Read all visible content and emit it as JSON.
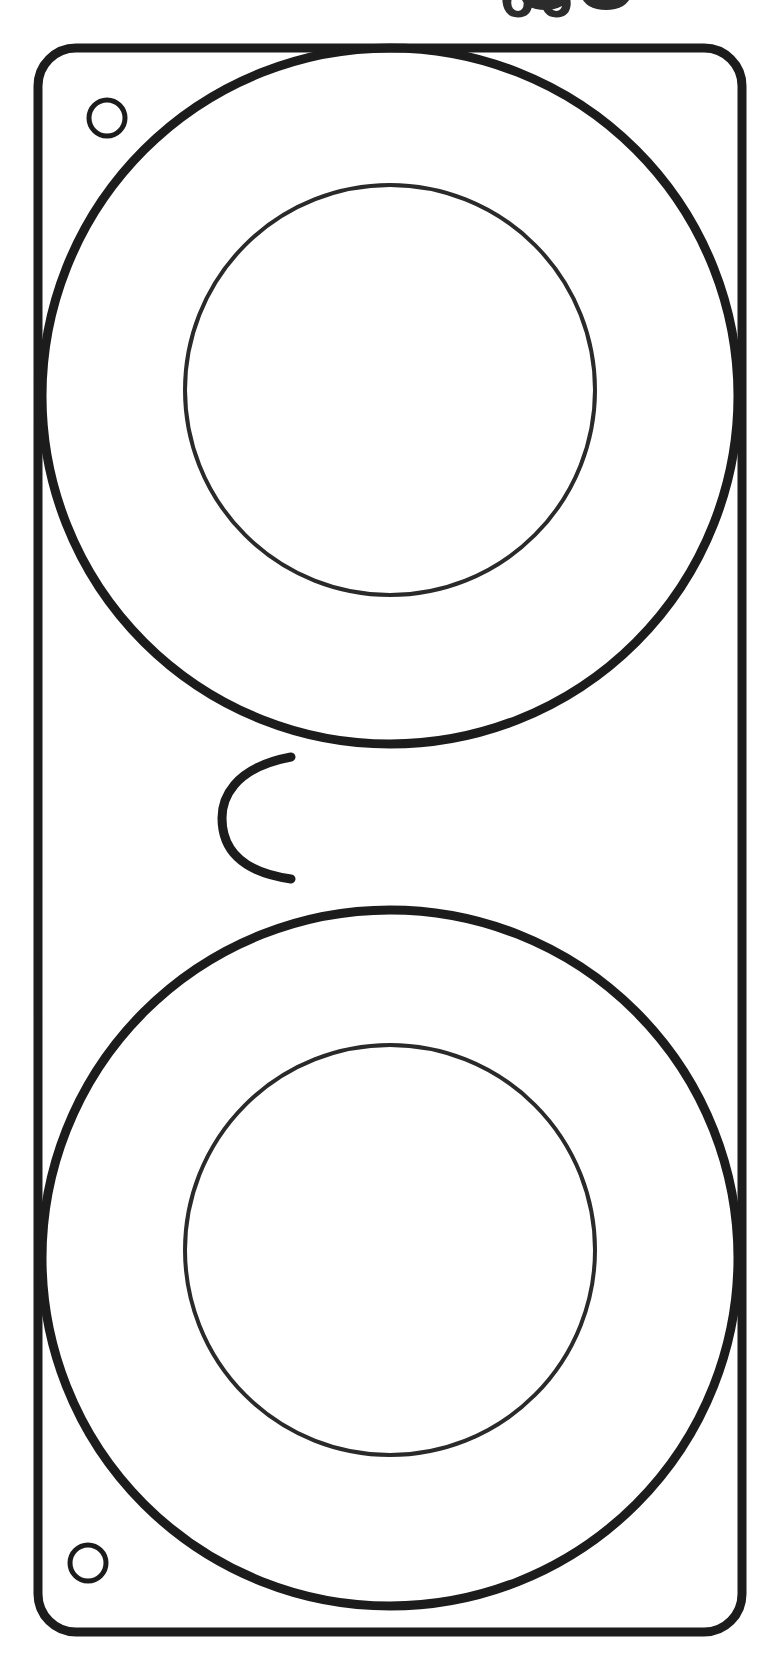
{
  "figure": {
    "kind": "technical-line-drawing",
    "canvas": {
      "width": 767,
      "height": 1661,
      "background": "#ffffff"
    },
    "ink": {
      "heavy": "#1c1c1c",
      "light": "#2a2a2a",
      "heavy_width": 9,
      "light_width": 4,
      "hole_width": 5
    },
    "caption": {
      "text": "66",
      "note": "partially cropped at top edge of image",
      "visible_fragment": "two rounded glyph bottoms"
    },
    "plate": {
      "name": "mounting-plate",
      "left": 38,
      "top": 48,
      "right": 742,
      "bottom": 1632,
      "corner_radius": 38,
      "stroke_width": 9
    },
    "bosses": [
      {
        "name": "upper-boss",
        "outer": {
          "cx": 390,
          "cy": 396,
          "r": 348,
          "stroke_width": 9
        },
        "inner": {
          "cx": 390,
          "cy": 390,
          "r": 205,
          "stroke_width": 4
        }
      },
      {
        "name": "lower-boss",
        "outer": {
          "cx": 390,
          "cy": 1258,
          "r": 348,
          "stroke_width": 9
        },
        "inner": {
          "cx": 390,
          "cy": 1250,
          "r": 205,
          "stroke_width": 4
        }
      }
    ],
    "waist": {
      "name": "bridge-waist",
      "top_junction": {
        "x": 291,
        "y": 757
      },
      "bottom_junction": {
        "x": 291,
        "y": 879
      },
      "leftmost_x": 222,
      "stroke_width": 9
    },
    "holes": [
      {
        "name": "upper-mounting-hole",
        "cx": 107,
        "cy": 118,
        "r": 18,
        "stroke_width": 5
      },
      {
        "name": "lower-mounting-hole",
        "cx": 88,
        "cy": 1563,
        "r": 18,
        "stroke_width": 5
      }
    ],
    "glyph_fragments": [
      {
        "name": "caption-glyph-left",
        "cx": 545,
        "cy": -4,
        "rx": 24,
        "ry": 14
      },
      {
        "name": "caption-glyph-right",
        "cx": 606,
        "cy": -4,
        "rx": 24,
        "ry": 14
      }
    ]
  }
}
